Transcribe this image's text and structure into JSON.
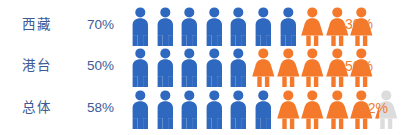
{
  "chart_data": {
    "type": "bar",
    "chart_style": "pictogram",
    "title": "",
    "xlabel": "",
    "ylabel": "",
    "unit_note": "each icon = 10%",
    "icons_per_row": 10,
    "legend": [
      {
        "name": "male-blue",
        "color": "#2f68bf",
        "icon": "male-person-icon"
      },
      {
        "name": "female-orange",
        "color": "#f4792a",
        "icon": "female-person-icon"
      }
    ],
    "categories": [
      "西藏",
      "港台",
      "总体"
    ],
    "series": [
      {
        "name": "blue",
        "values": [
          70,
          50,
          58
        ]
      },
      {
        "name": "orange",
        "values": [
          30,
          50,
          42
        ]
      }
    ],
    "rows": [
      {
        "label": "西藏",
        "left_value": "70%",
        "right_value": "30%",
        "blue_full": 7,
        "blue_partial": 0,
        "orange_full": 3,
        "orange_partial": 0
      },
      {
        "label": "港台",
        "left_value": "50%",
        "right_value": "50%",
        "blue_full": 5,
        "blue_partial": 0,
        "orange_full": 5,
        "orange_partial": 0
      },
      {
        "label": "总体",
        "left_value": "58%",
        "right_value": "42%",
        "blue_full": 5,
        "blue_partial": 80,
        "orange_full": 4,
        "orange_partial": 20
      }
    ]
  },
  "colors": {
    "blue": "#2f68bf",
    "orange": "#f4792a",
    "label_text": "#3d5a96",
    "right_text": "#ef7e33",
    "ghost": "#dcdcdc",
    "background": "#ffffff"
  },
  "rows": {
    "0": {
      "label": "西藏",
      "left": "70%",
      "right": "30%"
    },
    "1": {
      "label": "港台",
      "left": "50%",
      "right": "50%"
    },
    "2": {
      "label": "总体",
      "left": "58%",
      "right": "42%"
    }
  }
}
